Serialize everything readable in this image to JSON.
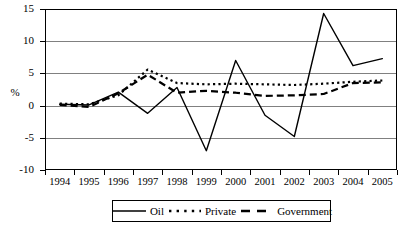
{
  "chart_data": {
    "type": "line",
    "title": "",
    "xlabel": "",
    "ylabel": "%",
    "categories": [
      "1994",
      "1995",
      "1996",
      "1997",
      "1998",
      "1999",
      "2000",
      "2001",
      "2002",
      "2003",
      "2004",
      "2005"
    ],
    "ylim": [
      -10,
      15
    ],
    "yticks": [
      15,
      10,
      5,
      0,
      -5,
      -10
    ],
    "ytick_labels": [
      "15",
      "10",
      "5",
      "0",
      "-5",
      "-10"
    ],
    "grid": true,
    "grid_axis": "y",
    "legend_position": "bottom-center",
    "series": [
      {
        "name": "Oil",
        "style": "solid",
        "color": "#000000",
        "values": [
          0.2,
          0.1,
          2.1,
          -1.2,
          2.8,
          -7.0,
          7.0,
          -1.5,
          -4.8,
          14.3,
          6.2,
          7.3
        ]
      },
      {
        "name": "Private",
        "style": "dotted",
        "color": "#000000",
        "values": [
          0.3,
          0.2,
          1.6,
          5.6,
          3.5,
          3.3,
          3.4,
          3.3,
          3.2,
          3.4,
          3.7,
          3.9
        ]
      },
      {
        "name": "Government",
        "style": "dashed",
        "color": "#000000",
        "values": [
          0.1,
          -0.2,
          1.9,
          4.8,
          2.0,
          2.3,
          2.0,
          1.5,
          1.6,
          1.8,
          3.5,
          3.6
        ]
      }
    ]
  },
  "legend": {
    "items": [
      {
        "label": "Oil",
        "style": "solid"
      },
      {
        "label": "Private",
        "style": "dotted"
      },
      {
        "label": "Government",
        "style": "dashed"
      }
    ]
  }
}
